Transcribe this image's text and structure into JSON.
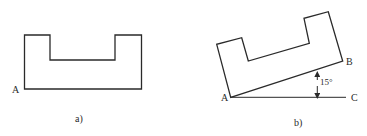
{
  "figures": [
    {
      "id": "a",
      "caption": "a)",
      "labels": {
        "A": "A"
      },
      "shape": "U-shaped profile, horizontal"
    },
    {
      "id": "b",
      "caption": "b)",
      "labels": {
        "A": "A",
        "B": "B",
        "C": "C"
      },
      "angle": "15°",
      "shape": "U-shaped profile rotated 15° about point A"
    }
  ],
  "colors": {
    "stroke": "#2a2a2a",
    "background": "#ffffff"
  }
}
